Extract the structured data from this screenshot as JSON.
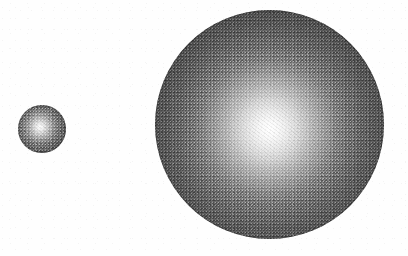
{
  "figure": {
    "canvas": {
      "width": 408,
      "height": 256,
      "background_color": "#fefefe"
    },
    "objects": [
      {
        "name": "small-sphere",
        "label": "Small sphere",
        "center_x": 42,
        "center_y": 129,
        "radius": 24,
        "diameter": 48,
        "highlight_x": 40,
        "highlight_y": 127,
        "highlight_color": "#fdfdfd",
        "edge_color": "#484848",
        "texture": "halftone-grain"
      },
      {
        "name": "large-sphere",
        "label": "Large sphere",
        "center_x": 269,
        "center_y": 124,
        "radius": 114,
        "diameter": 229,
        "highlight_x": 270,
        "highlight_y": 129,
        "highlight_color": "#ffffff",
        "edge_color": "#3d3d3d",
        "texture": "halftone-grain"
      }
    ],
    "palette": {
      "background": "#fefefe",
      "highlight": "#ffffff",
      "midtone": "#797979",
      "shadow": "#3d3d3d"
    }
  }
}
